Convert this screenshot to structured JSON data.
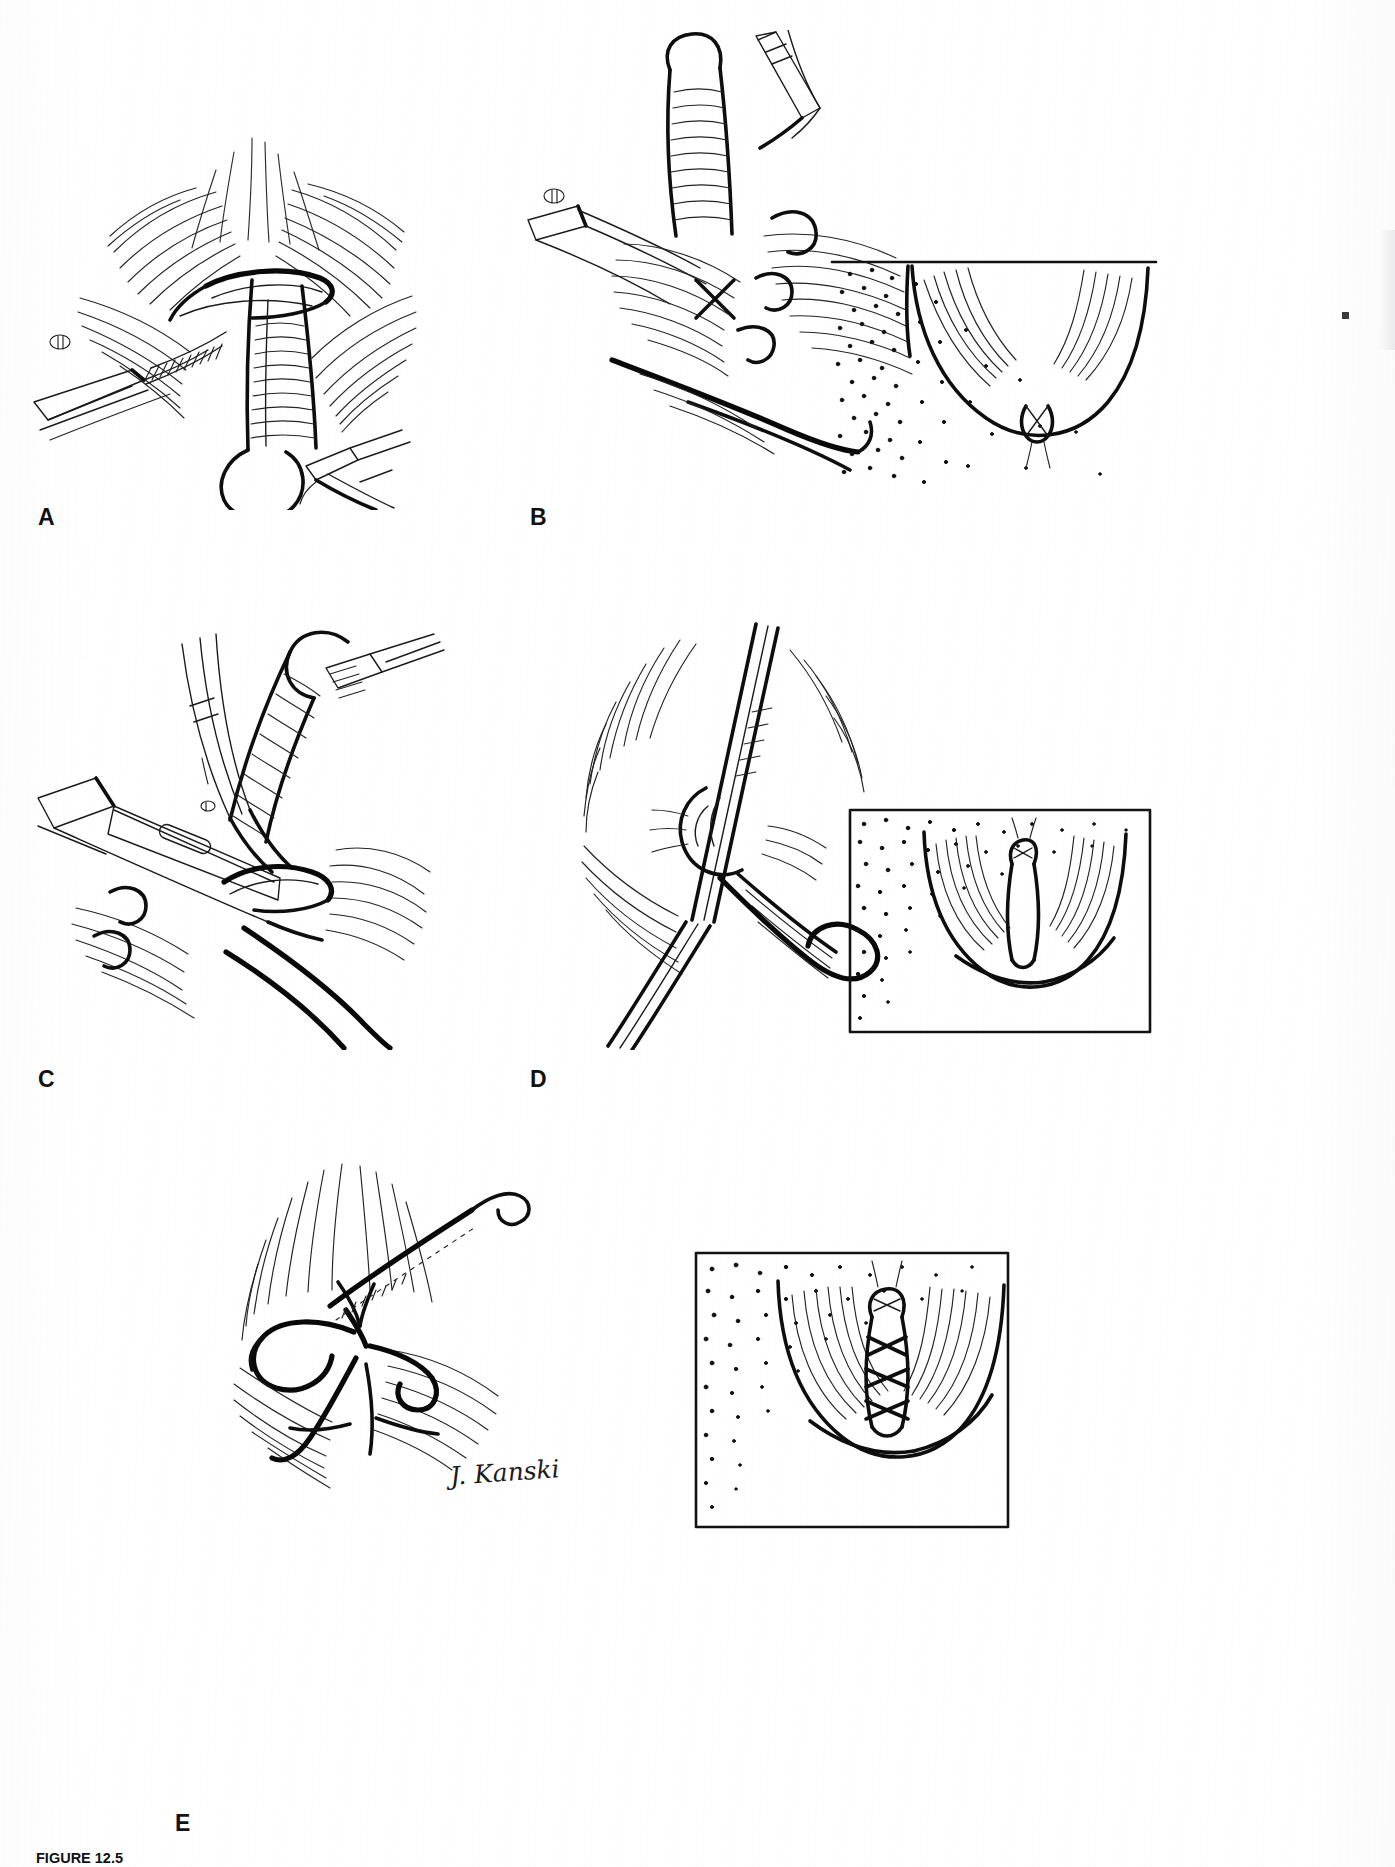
{
  "document": {
    "type": "textbook-figure-page",
    "page_background": "#ffffff",
    "ink_color": "#111111",
    "artist_signature": "J. Kanski"
  },
  "figure": {
    "number_label": "FIGURE 12.5",
    "caption_visible_text": "FIGURE 12.5  A, The marked base of the...",
    "caption_clipped": true,
    "panels": [
      {
        "id": "A",
        "letter": "A",
        "letter_x": 38,
        "letter_y": 506,
        "subject": "surgical line drawing",
        "description": "Tissue held with forceps; strip of tissue retracted over a blade/retractor with hatched cut edge",
        "has_inset": false,
        "inset_stipple": false
      },
      {
        "id": "B",
        "letter": "B",
        "letter_x": 530,
        "letter_y": 506,
        "subject": "surgical line drawing",
        "description": "Clamped pedicle with sutures placed; curved needle passing through tissue",
        "has_inset": true,
        "inset_stipple": true,
        "inset_description": "Stippled quadrant inset showing draped anatomical outline with small knotted suture at centre"
      },
      {
        "id": "C",
        "letter": "C",
        "letter_x": 38,
        "letter_y": 1068,
        "subject": "surgical line drawing",
        "description": "Fenestrated clamp applied; scissors and curved needle approaching the tissue bridge",
        "has_inset": false,
        "inset_stipple": false
      },
      {
        "id": "D",
        "letter": "D",
        "letter_x": 530,
        "letter_y": 1068,
        "subject": "surgical line drawing",
        "description": "Tissue tented by a long instrument, suture loop dropping below",
        "has_inset": true,
        "inset_stipple": true,
        "inset_description": "Stippled quadrant inset showing the closed defect with a vertical double-line repair and small knot"
      },
      {
        "id": "E",
        "letter": "E",
        "letter_x": 175,
        "letter_y": 1812,
        "subject": "surgical line drawing",
        "description": "Final suture placement with two curved needles and looping threads across the closure",
        "has_inset": true,
        "inset_stipple": true,
        "inset_description": "Stippled quadrant inset showing completed closure with three interrupted knots along the vertical repair"
      }
    ]
  },
  "page_edge": {
    "has_thumb_tab": true,
    "has_edge_mark": true
  }
}
